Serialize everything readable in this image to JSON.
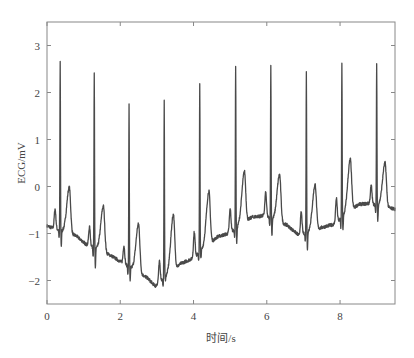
{
  "chart_data": {
    "type": "line",
    "title": "",
    "xlabel": "时间/s",
    "ylabel": "ECG/mV",
    "xlim": [
      0,
      9.5
    ],
    "ylim": [
      -2.5,
      3.5
    ],
    "xticks": [
      0,
      2,
      4,
      6,
      8
    ],
    "xtick_labels": [
      "0",
      "2",
      "4",
      "6",
      "8"
    ],
    "yticks": [
      -2,
      -1,
      0,
      1,
      2,
      3
    ],
    "ytick_labels": [
      "−2",
      "−1",
      "0",
      "1",
      "2",
      "3"
    ],
    "grid": false,
    "legend": null,
    "line_color": "#4a4a4a",
    "series": [
      {
        "name": "ECG",
        "description": "ECG trace with 10 heartbeats and baseline wander",
        "r_peaks": {
          "t": [
            0.36,
            1.29,
            2.24,
            3.2,
            4.17,
            5.15,
            6.11,
            7.08,
            8.05,
            9.0
          ],
          "mv": [
            2.63,
            2.42,
            1.76,
            1.8,
            2.21,
            2.58,
            2.61,
            2.42,
            2.61,
            2.61
          ]
        },
        "p_waves": {
          "t": [
            0.22,
            1.16,
            2.1,
            3.07,
            4.02,
            5.0,
            5.97,
            6.94,
            7.9,
            8.85
          ],
          "mv": [
            -0.48,
            -0.86,
            -1.26,
            -1.6,
            -0.97,
            -0.48,
            -0.13,
            -0.55,
            -0.25,
            0.02
          ]
        },
        "s_dips": {
          "mv": [
            -1.26,
            -1.72,
            -2.0,
            -2.02,
            -1.57,
            -1.22,
            -1.05,
            -1.36,
            -0.94,
            -0.75
          ]
        },
        "t_waves": {
          "t": [
            0.61,
            1.54,
            2.5,
            3.45,
            4.42,
            5.39,
            6.35,
            7.32,
            8.28,
            9.23
          ],
          "mv": [
            -0.02,
            -0.42,
            -0.8,
            -0.59,
            -0.1,
            0.32,
            0.25,
            0.04,
            0.58,
            0.5
          ]
        },
        "baseline": {
          "t": [
            0.0,
            0.15,
            0.8,
            1.05,
            1.75,
            2.05,
            2.75,
            2.95,
            3.05,
            3.65,
            3.98,
            4.65,
            4.95,
            5.6,
            5.92,
            6.55,
            6.88,
            7.55,
            7.85,
            8.5,
            8.8,
            9.5
          ],
          "mv": [
            -0.84,
            -0.88,
            -1.05,
            -1.22,
            -1.47,
            -1.62,
            -1.95,
            -2.12,
            -2.05,
            -1.64,
            -1.53,
            -1.07,
            -1.0,
            -0.65,
            -0.62,
            -0.82,
            -1.04,
            -0.86,
            -0.8,
            -0.38,
            -0.36,
            -0.48
          ]
        }
      }
    ]
  }
}
